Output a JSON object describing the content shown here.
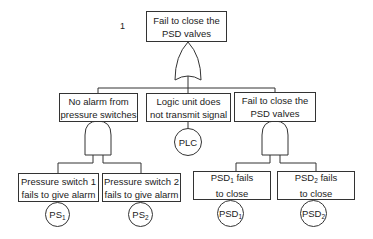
{
  "diagram": {
    "type": "fault-tree",
    "top_event": {
      "index_label": "1",
      "line1": "Fail to close the",
      "line2": "PSD valves",
      "gate": "OR"
    },
    "intermediate_events": [
      {
        "id": "no-alarm",
        "line1": "No alarm from",
        "line2": "pressure switches",
        "gate": "AND"
      },
      {
        "id": "logic-unit",
        "line1": "Logic unit does",
        "line2": "not transmit signal",
        "basic_event": {
          "base": "PLC",
          "sub": ""
        }
      },
      {
        "id": "fail-close-psd",
        "line1": "Fail to close the",
        "line2": "PSD valves",
        "gate": "AND"
      }
    ],
    "basic_events": [
      {
        "line1": "Pressure switch 1",
        "line2": "fails to give alarm",
        "symbol": {
          "base": "PS",
          "sub": "1"
        }
      },
      {
        "line1": "Pressure switch 2",
        "line2": "fails to give alarm",
        "symbol": {
          "base": "PS",
          "sub": "2"
        }
      },
      {
        "line1_base": "PSD",
        "line1_sub": "1",
        "line1_rest": " fails",
        "line2": "to close",
        "symbol": {
          "base": "PSD",
          "sub": "1"
        }
      },
      {
        "line1_base": "PSD",
        "line1_sub": "2",
        "line1_rest": " fails",
        "line2": "to close",
        "symbol": {
          "base": "PSD",
          "sub": "2"
        }
      }
    ]
  }
}
